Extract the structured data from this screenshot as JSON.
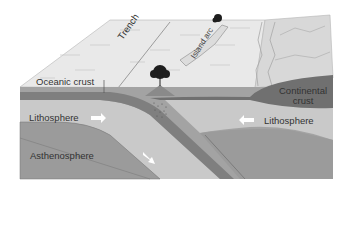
{
  "diagram": {
    "labels": {
      "oceanic_crust": "Oceanic crust",
      "trench": "Trench",
      "island_arc": "Island arc",
      "continental_crust_line1": "Continental",
      "continental_crust_line2": "crust",
      "lithosphere_left": "Lithosphere",
      "lithosphere_right": "Lithosphere",
      "asthenosphere": "Asthenosphere"
    },
    "arrows": [
      {
        "name": "lithosphere-left-motion",
        "direction": "right"
      },
      {
        "name": "subducting-slab-motion",
        "direction": "down-right"
      },
      {
        "name": "lithosphere-right-motion",
        "direction": "left"
      }
    ],
    "features": [
      "volcano-tree-icon",
      "island-volcano-icon",
      "magma-rising-dots"
    ],
    "colors": {
      "surface": "#e8e8e8",
      "continent_surface": "#d6d6d6",
      "oceanic_crust": "#7d7d7d",
      "lithosphere": "#c8c8c8",
      "asthenosphere": "#9a9a9a",
      "continental_crust": "#6f6f6f",
      "outline": "#5a5a5a"
    }
  }
}
